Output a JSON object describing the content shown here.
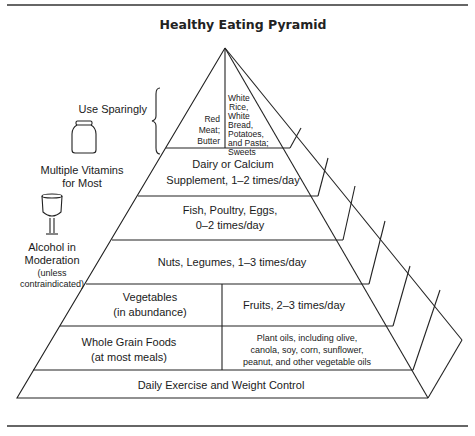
{
  "title": "Healthy Eating Pyramid",
  "side_labels": {
    "use_sparingly": "Use Sparingly",
    "vitamins_line1": "Multiple Vitamins",
    "vitamins_line2": "for Most",
    "alcohol_line1": "Alcohol in",
    "alcohol_line2": "Moderation",
    "alcohol_line3": "(unless",
    "alcohol_line4": "contraindicated)"
  },
  "icons": {
    "vitamin": "vitamin-jar-icon",
    "alcohol": "wine-glass-icon"
  },
  "tiers": {
    "top_left": [
      "Red",
      "Meat;",
      "Butter"
    ],
    "top_right": [
      "White",
      "Rice,",
      "White",
      "Bread,",
      "Potatoes,",
      "and Pasta;",
      "Sweets"
    ],
    "dairy": [
      "Dairy or Calcium",
      "Supplement, 1–2 times/day"
    ],
    "fish": [
      "Fish, Poultry, Eggs,",
      "0–2 times/day"
    ],
    "nuts": [
      "Nuts, Legumes, 1–3 times/day"
    ],
    "vegetables": [
      "Vegetables",
      "(in abundance)"
    ],
    "fruits": [
      "Fruits, 2–3 times/day"
    ],
    "grains": [
      "Whole Grain Foods",
      "(at most meals)"
    ],
    "oils": [
      "Plant oils, including olive,",
      "canola, soy, corn, sunflower,",
      "peanut, and other vegetable oils"
    ],
    "base": [
      "Daily Exercise and Weight Control"
    ]
  }
}
